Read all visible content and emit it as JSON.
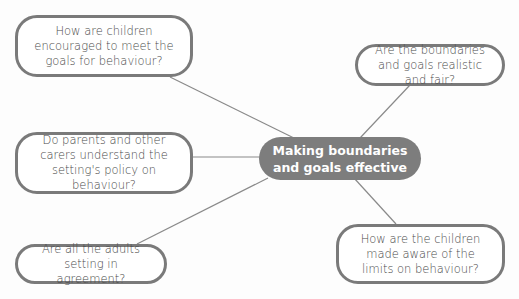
{
  "diagram": {
    "type": "mind-map",
    "colors": {
      "line": "#8a8a8a",
      "node_border": "#7a7a7a",
      "center_fill": "#7d7d7d",
      "center_text": "#ffffff",
      "node_text": "#4a4a4a"
    },
    "center": {
      "label": "Making boundaries and goals effective"
    },
    "nodes": [
      {
        "id": "top-left",
        "label": "How are children encouraged to meet the goals for behaviour?"
      },
      {
        "id": "top-right",
        "label": "Are the boundaries and goals realistic and fair?"
      },
      {
        "id": "middle-left",
        "label": "Do parents and other carers understand the setting's policy on behaviour?"
      },
      {
        "id": "bottom-left",
        "label": "Are all the adults setting in agreement?"
      },
      {
        "id": "bottom-right",
        "label": "How are the children made aware of the limits on behaviour?"
      }
    ]
  }
}
